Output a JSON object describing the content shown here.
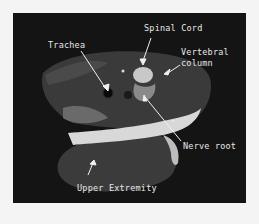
{
  "figure": {
    "type": "axial MRI cross-section",
    "labels": {
      "spinal_cord": "Spinal Cord",
      "trachea": "Trachea",
      "vertebral_line1": "Vertebral",
      "vertebral_line2": "column",
      "nerve_root": "Nerve root",
      "upper_extremity": "Upper Extremity"
    },
    "colors": {
      "page_background": "#f4f4f4",
      "scan_background": "#141414",
      "label_text": "#e8e8e8"
    }
  }
}
